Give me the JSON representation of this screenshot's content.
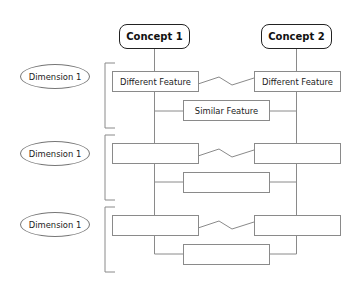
{
  "concepts": [
    {
      "label": "Concept 1"
    },
    {
      "label": "Concept 2"
    }
  ],
  "dimensions": [
    {
      "label": "Dimension 1",
      "left_feature": "Different Feature",
      "right_feature": "Different Feature",
      "similar_feature": "Similar Feature",
      "relation_left_right": "different"
    },
    {
      "label": "Dimension 1",
      "left_feature": "",
      "right_feature": "",
      "similar_feature": "",
      "relation_left_right": "different"
    },
    {
      "label": "Dimension 1",
      "left_feature": "",
      "right_feature": "",
      "similar_feature": "",
      "relation_left_right": "different"
    }
  ],
  "colors": {
    "line": "#8a8a8a",
    "concept_border": "#222222",
    "background": "#ffffff"
  }
}
